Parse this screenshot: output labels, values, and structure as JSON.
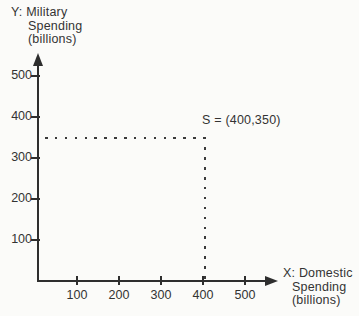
{
  "chart": {
    "y_title_lines": [
      "Y: Military",
      "Spending",
      "(billions)"
    ],
    "x_title_lines": [
      "X: Domestic",
      "Spending",
      "(billions)"
    ],
    "point_label": "S = (400,350)"
  },
  "chart_data": {
    "type": "scatter",
    "title": "",
    "xlabel": "X: Domestic Spending (billions)",
    "ylabel": "Y: Military Spending (billions)",
    "x_ticks": [
      100,
      200,
      300,
      400,
      500
    ],
    "y_ticks": [
      100,
      200,
      300,
      400,
      500
    ],
    "xlim": [
      0,
      575
    ],
    "ylim": [
      0,
      550
    ],
    "grid": false,
    "points": [
      {
        "name": "S",
        "x": 400,
        "y": 350,
        "label": "S = (400,350)"
      }
    ],
    "annotations": [
      "dotted horizontal guide line from y-axis at 350 to point S",
      "dotted vertical guide line from point S down to x-axis at 400"
    ],
    "colors": {
      "axis": "#2e2e2e",
      "text": "#333333",
      "guide_dots": "#3a3a3a",
      "background": "#fbfbf9"
    }
  }
}
